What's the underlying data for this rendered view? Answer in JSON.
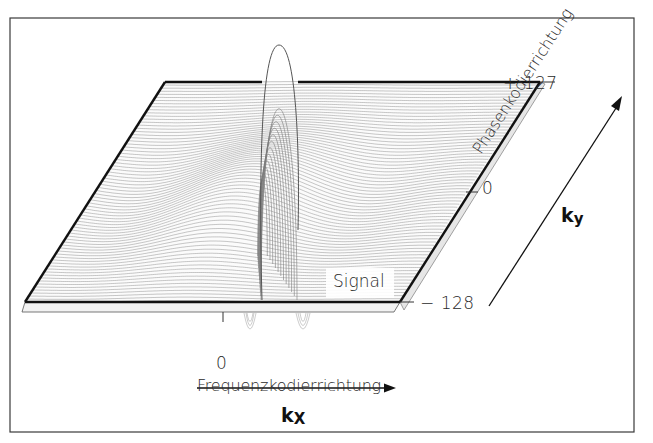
{
  "diagram": {
    "colors": {
      "frame": "#3a3a3a",
      "plate_edge": "#111111",
      "mesh": "#8a8a8a",
      "text": "#2a2a2a",
      "background": "#ffffff"
    },
    "labels": {
      "ky_top": "+ 127",
      "ky_mid": "0",
      "ky_bottom": "− 128",
      "kx_zero": "0",
      "signal": "Signal",
      "x_axis_title": "Frequenzkodierrichtung",
      "x_axis_symbol_base": "k",
      "x_axis_symbol_sub": "X",
      "y_axis_title": "Phasenkodierrichtung",
      "y_axis_symbol_base": "k",
      "y_axis_symbol_sub": "y"
    },
    "axes": {
      "kx": {
        "zero_tick": 0,
        "direction": "right"
      },
      "ky": {
        "range": [
          -128,
          127
        ],
        "ticks": [
          -128,
          0,
          127
        ],
        "direction": "up-right"
      }
    },
    "surface": {
      "description": "3D wireframe of MR signal over k-space plane, central peak with side lobes (sinc-like)",
      "peak_label": "Signal"
    }
  }
}
